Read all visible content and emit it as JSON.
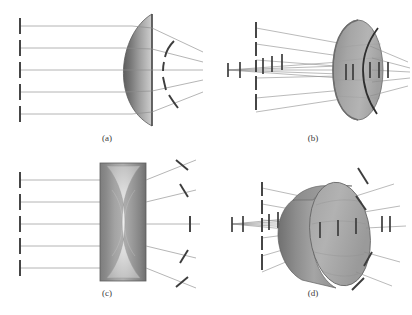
{
  "figure": {
    "kind": "optics-wavefront-diagram",
    "background_color": "#ffffff",
    "width": 412,
    "height": 315,
    "ray_color": "#8c8c8c",
    "wavefront_color": "#3d3d3d",
    "lens_edge_color": "#5d5d5d",
    "lens_fill_light": "#d4d4d4",
    "lens_fill_mid": "#a8a8a8",
    "lens_fill_dark": "#6e6e6e",
    "lens_fill_darker": "#5a5a5a"
  },
  "panels": [
    {
      "id": "a",
      "label": "(a)",
      "label_x": 107,
      "label_y": 141,
      "view": "2d-cross-section",
      "lens_type": "plano-convex-converging",
      "description": "Parallel plane wavefronts on the left converge to curved wavefronts after a plano-convex lens",
      "incoming_wavefronts": 5,
      "outgoing_wavefronts": 4,
      "axis_y": 70
    },
    {
      "id": "b",
      "label": "(b)",
      "label_x": 313,
      "label_y": 141,
      "view": "3d-perspective",
      "lens_type": "plano-convex-converging",
      "description": "Three-dimensional perspective view of plane wavefronts converging through a converging lens shown as an ellipse",
      "incoming_wavefronts": 5,
      "outgoing_wavefronts": 4,
      "axis_y": 70
    },
    {
      "id": "c",
      "label": "(c)",
      "label_x": 107,
      "label_y": 296,
      "view": "2d-cross-section",
      "lens_type": "biconcave-diverging",
      "description": "Parallel plane wavefronts diverge after passing through a biconcave lens",
      "incoming_wavefronts": 5,
      "outgoing_wavefronts": 5,
      "axis_y": 224
    },
    {
      "id": "d",
      "label": "(d)",
      "label_x": 313,
      "label_y": 296,
      "view": "3d-perspective",
      "lens_type": "biconcave-diverging",
      "description": "Three-dimensional perspective view of plane wavefronts diverging through a diverging lens shown as a cylinder",
      "incoming_wavefronts": 5,
      "outgoing_wavefronts": 5,
      "axis_y": 224
    }
  ]
}
